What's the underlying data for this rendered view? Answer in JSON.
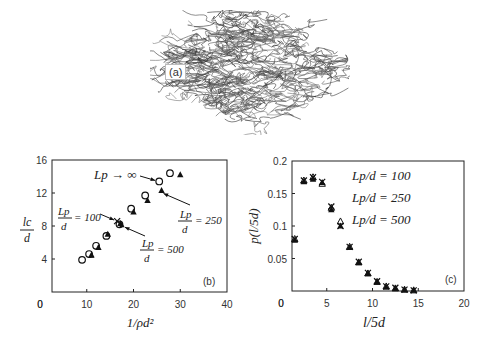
{
  "panel_a": {
    "label": "(a)",
    "description": "random fiber network (tangled mat)"
  },
  "chart_data": [
    {
      "id": "b",
      "type": "scatter",
      "panel_label": "(b)",
      "title": "",
      "xlabel": "1/ρd²",
      "ylabel": "l_c/d",
      "xlim": [
        0,
        40
      ],
      "ylim": [
        0,
        16
      ],
      "xticks": [
        0,
        10,
        20,
        30,
        40
      ],
      "yticks": [
        4,
        8,
        12,
        16
      ],
      "grid": false,
      "series": [
        {
          "name": "Lp → ∞",
          "marker": "open-circle",
          "x": [
            9,
            10.5,
            12,
            14.2,
            17,
            19.5,
            22.5,
            25.5,
            27.8
          ],
          "y": [
            3.9,
            4.6,
            5.6,
            6.8,
            8.2,
            10.1,
            11.7,
            13.4,
            14.4
          ]
        },
        {
          "name": "Lp/d = 250",
          "marker": "filled-triangle",
          "x": [
            11,
            12.5,
            14.5,
            17.2,
            20,
            23,
            26,
            30
          ],
          "y": [
            4.5,
            5.4,
            7.0,
            8.3,
            9.7,
            11.1,
            12.3,
            14.2
          ]
        },
        {
          "name": "Lp/d = 100",
          "marker": "cross",
          "x": [
            16.5
          ],
          "y": [
            8.6
          ]
        },
        {
          "name": "Lp/d = 500",
          "marker": "filled-triangle-small",
          "x": [
            11,
            17.5
          ],
          "y": [
            4.4,
            8.1
          ]
        }
      ],
      "annotations": [
        {
          "text": "Lp → ∞",
          "points_to": [
            25.5,
            13.4
          ]
        },
        {
          "text": "Lp/d = 100",
          "points_to": [
            16.5,
            8.6
          ]
        },
        {
          "text": "Lp/d = 250",
          "points_to": [
            26,
            12.3
          ]
        },
        {
          "text": "Lp/d = 500",
          "points_to": [
            17.5,
            8.1
          ]
        }
      ]
    },
    {
      "id": "c",
      "type": "scatter",
      "panel_label": "(c)",
      "title": "",
      "xlabel": "l/5d",
      "ylabel": "p(l/5d)",
      "xlim": [
        0,
        20
      ],
      "ylim": [
        0,
        0.2
      ],
      "xticks": [
        0,
        5,
        10,
        15,
        20
      ],
      "yticks": [
        0.05,
        0.1,
        0.15,
        0.2
      ],
      "grid": false,
      "legend": [
        "Lp/d = 100",
        "Lp/d = 250",
        "Lp/d = 500"
      ],
      "legend_position": "upper right",
      "x": [
        1.5,
        2.5,
        3.5,
        4.5,
        5.5,
        6.5,
        7.5,
        8.5,
        9.5,
        10.5,
        11.5,
        12.5,
        13.5,
        14.5
      ],
      "series": [
        {
          "name": "Lp/d = 100",
          "marker": "cross",
          "values": [
            0.08,
            0.17,
            0.175,
            0.168,
            0.13,
            0.1,
            0.068,
            0.045,
            0.028,
            0.015,
            0.007,
            0.005,
            0.002,
            0.001
          ]
        },
        {
          "name": "Lp/d = 250",
          "marker": "open-triangle",
          "values": [
            0.08,
            0.17,
            0.175,
            0.165,
            0.128,
            0.107,
            0.068,
            0.044,
            0.027,
            0.014,
            0.007,
            0.004,
            0.002,
            0.001
          ]
        },
        {
          "name": "Lp/d = 500",
          "marker": "filled-triangle",
          "values": [
            0.078,
            0.168,
            0.172,
            0.167,
            0.125,
            0.1,
            0.067,
            0.044,
            0.027,
            0.014,
            0.006,
            0.004,
            0.002,
            0.001
          ]
        }
      ]
    }
  ]
}
